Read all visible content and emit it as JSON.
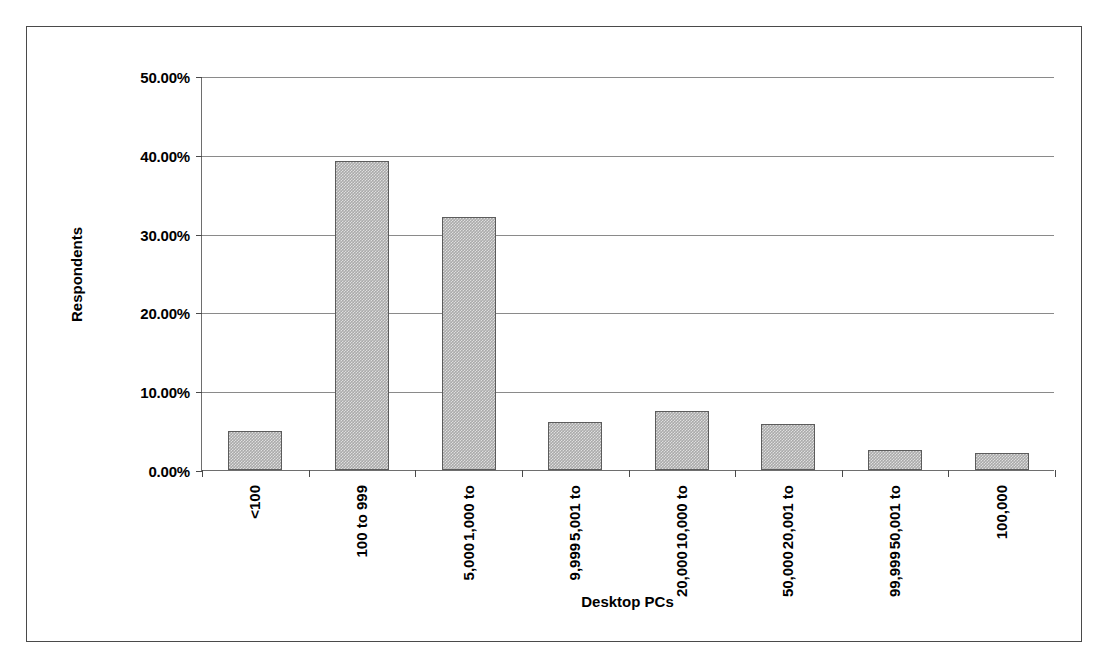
{
  "chart_data": {
    "type": "bar",
    "title": "",
    "xlabel": "Desktop PCs",
    "ylabel": "Respondents",
    "categories": [
      "<100",
      "100 to 999",
      "1,000 to 5,000",
      "5,001 to 9,999",
      "10,000 to 20,000",
      "20,001 to 50,000",
      "50,001 to 99,999",
      "100,000"
    ],
    "category_lines": [
      [
        "<100"
      ],
      [
        "100 to 999"
      ],
      [
        "1,000 to",
        "5,000"
      ],
      [
        "5,001 to",
        "9,999"
      ],
      [
        "10,000 to",
        "20,000"
      ],
      [
        "20,001 to",
        "50,000"
      ],
      [
        "50,001 to",
        "99,999"
      ],
      [
        "100,000"
      ]
    ],
    "values": [
      4.9,
      39.2,
      32.1,
      6.1,
      7.5,
      5.8,
      2.6,
      2.1
    ],
    "value_unit": "percent",
    "ylim": [
      0,
      50
    ],
    "ytick_values": [
      0,
      10,
      20,
      30,
      40,
      50
    ],
    "ytick_labels": [
      "0.00%",
      "10.00%",
      "20.00%",
      "30.00%",
      "40.00%",
      "50.00%"
    ],
    "grid": true,
    "legend": false,
    "bar_fill_color": "#aaaaaa",
    "bar_border_color": "#5c5c5c",
    "axis_color": "#4a4a4a",
    "gridline_color": "#8a8a8a",
    "frame_color": "#4a4a4a",
    "background_color": "#ffffff"
  }
}
